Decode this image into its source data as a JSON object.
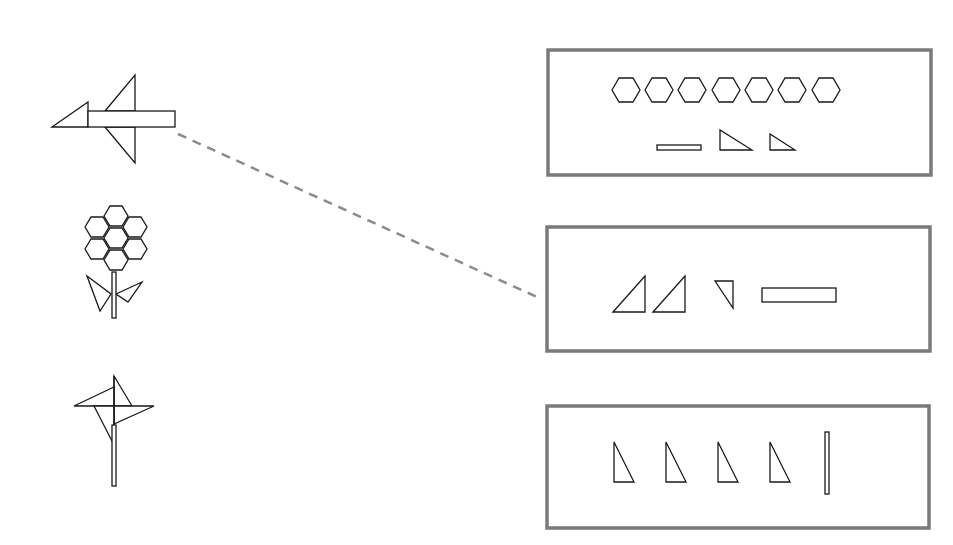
{
  "task": {
    "type": "match-figure-to-pieces",
    "figures": [
      {
        "id": "airplane",
        "label": "airplane figure"
      },
      {
        "id": "flower",
        "label": "flower figure"
      },
      {
        "id": "pinwheel",
        "label": "pinwheel figure"
      }
    ],
    "piece_boxes": [
      {
        "id": "box-1",
        "contents": "7 hexagons, 1 thin bar, 2 right triangles"
      },
      {
        "id": "box-2",
        "contents": "2 right triangles, 1 small triangle, 1 rectangle"
      },
      {
        "id": "box-3",
        "contents": "4 right triangles, 1 vertical thin bar"
      }
    ],
    "connections": [
      {
        "from": "airplane",
        "to": "box-2",
        "style": "dashed"
      }
    ]
  },
  "colors": {
    "outline": "#1a1a1a",
    "box_border": "#7a7a7a",
    "connector": "#8c8c8c",
    "background": "#ffffff"
  }
}
